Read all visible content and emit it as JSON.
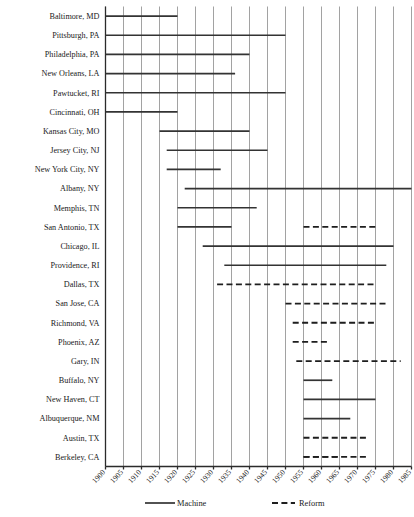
{
  "chart_data": {
    "type": "bar",
    "orientation": "horizontal-range",
    "title": "",
    "subtitle": "",
    "xlabel": "",
    "ylabel": "",
    "xlim": [
      1898,
      1987
    ],
    "grid": "vertical",
    "legend_position": "bottom",
    "x_ticks": [
      "1900",
      "1905",
      "1910",
      "1915",
      "1920",
      "1925",
      "1930",
      "1935",
      "1940",
      "1945",
      "1950",
      "1955",
      "1960",
      "1965",
      "1970",
      "1975",
      "1980",
      "1985"
    ],
    "categories": [
      "Baltimore, MD",
      "Pittsburgh, PA",
      "Philadelphia, PA",
      "New Orleans, LA",
      "Pawtucket, RI",
      "Cincinnati, OH",
      "Kansas City, MO",
      "Jersey City, NJ",
      "New York City, NY",
      "Albany, NY",
      "Memphis, TN",
      "San Antonio, TX",
      "Chicago, IL",
      "Providence, RI",
      "Dallas, TX",
      "San Jose, CA",
      "Richmond, VA",
      "Phoenix, AZ",
      "Gary, IN",
      "Buffalo, NY",
      "New Haven, CT",
      "Albuquerque, NM",
      "Austin, TX",
      "Berkeley, CA"
    ],
    "series": [
      {
        "name": "Machine",
        "style": "solid",
        "color": "#333333"
      },
      {
        "name": "Reform",
        "style": "dashed",
        "color": "#1e1e1e"
      }
    ],
    "bars": [
      {
        "category": "Baltimore, MD",
        "series": "Machine",
        "start": 1898,
        "end": 1920
      },
      {
        "category": "Pittsburgh, PA",
        "series": "Machine",
        "start": 1898,
        "end": 1950
      },
      {
        "category": "Philadelphia, PA",
        "series": "Machine",
        "start": 1898,
        "end": 1940
      },
      {
        "category": "New Orleans, LA",
        "series": "Machine",
        "start": 1898,
        "end": 1936
      },
      {
        "category": "Pawtucket, RI",
        "series": "Machine",
        "start": 1898,
        "end": 1950
      },
      {
        "category": "Cincinnati, OH",
        "series": "Machine",
        "start": 1900,
        "end": 1920
      },
      {
        "category": "Kansas City, MO",
        "series": "Machine",
        "start": 1915,
        "end": 1940
      },
      {
        "category": "Jersey City, NJ",
        "series": "Machine",
        "start": 1917,
        "end": 1945
      },
      {
        "category": "New York City, NY",
        "series": "Machine",
        "start": 1917,
        "end": 1932
      },
      {
        "category": "Albany, NY",
        "series": "Machine",
        "start": 1922,
        "end": 1987
      },
      {
        "category": "Memphis, TN",
        "series": "Machine",
        "start": 1920,
        "end": 1942
      },
      {
        "category": "San Antonio, TX",
        "series": "Machine",
        "start": 1920,
        "end": 1935
      },
      {
        "category": "San Antonio, TX",
        "series": "Reform",
        "start": 1955,
        "end": 1975
      },
      {
        "category": "Chicago, IL",
        "series": "Machine",
        "start": 1927,
        "end": 1980
      },
      {
        "category": "Providence, RI",
        "series": "Machine",
        "start": 1933,
        "end": 1978
      },
      {
        "category": "Dallas, TX",
        "series": "Reform",
        "start": 1931,
        "end": 1975
      },
      {
        "category": "San Jose, CA",
        "series": "Reform",
        "start": 1950,
        "end": 1978
      },
      {
        "category": "Richmond, VA",
        "series": "Reform",
        "start": 1952,
        "end": 1975
      },
      {
        "category": "Phoenix, AZ",
        "series": "Reform",
        "start": 1952,
        "end": 1962
      },
      {
        "category": "Gary, IN",
        "series": "Reform",
        "start": 1953,
        "end": 1982
      },
      {
        "category": "Buffalo, NY",
        "series": "Machine",
        "start": 1955,
        "end": 1963
      },
      {
        "category": "New Haven, CT",
        "series": "Machine",
        "start": 1955,
        "end": 1975
      },
      {
        "category": "Albuquerque, NM",
        "series": "Machine",
        "start": 1955,
        "end": 1968
      },
      {
        "category": "Austin, TX",
        "series": "Reform",
        "start": 1955,
        "end": 1973
      },
      {
        "category": "Berkeley, CA",
        "series": "Reform",
        "start": 1955,
        "end": 1973
      },
      {
        "category": "Berkeley, CA",
        "series": "Reform2",
        "start": 1955,
        "end": 1965
      }
    ]
  },
  "legend": {
    "machine": "Machine",
    "reform": "Reform"
  }
}
